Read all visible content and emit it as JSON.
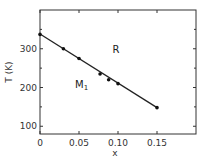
{
  "chart_data": {
    "type": "line",
    "title": "",
    "xlabel": "x",
    "ylabel": "T (K)",
    "xlim": [
      0,
      0.2
    ],
    "ylim": [
      80,
      400
    ],
    "xticks": [
      0,
      0.05,
      0.1,
      0.15
    ],
    "xtick_labels": [
      "0",
      "0.05",
      "0.10",
      "0.15"
    ],
    "yticks": [
      100,
      200,
      300
    ],
    "ytick_labels": [
      "100",
      "200",
      "300"
    ],
    "grid": false,
    "legend": null,
    "series": [
      {
        "name": "phase boundary",
        "marker": "filled-circle",
        "x": [
          0,
          0.03,
          0.05,
          0.077,
          0.088,
          0.1,
          0.15
        ],
        "y": [
          337,
          300,
          275,
          235,
          220,
          210,
          148
        ]
      }
    ],
    "fit_line": {
      "x": [
        0,
        0.15
      ],
      "y": [
        338,
        148
      ]
    },
    "annotations": [
      {
        "text": "R",
        "x": 0.093,
        "y": 290
      },
      {
        "text": "M",
        "subscript": "1",
        "x": 0.045,
        "y": 198
      }
    ]
  }
}
